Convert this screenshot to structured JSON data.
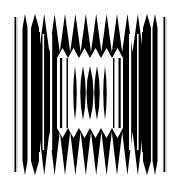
{
  "image": {
    "width": 180,
    "height": 185,
    "background": "#ffffff",
    "ink": "#000000",
    "description": "Black and white op-art pattern of vertical stripes with zigzag top and bottom bands and a central window of lens-shaped spindles"
  },
  "pattern": {
    "outer_lines_left": [
      {
        "x": 14.5,
        "w": 1.6,
        "y1": 17,
        "y2": 172,
        "tone": "#000000"
      },
      {
        "x": 16.2,
        "w": 1.4,
        "y1": 17,
        "y2": 172,
        "tone": "#bdbdbd"
      }
    ],
    "outer_lines_right": [
      {
        "x": 163.5,
        "w": 1.6,
        "y1": 17,
        "y2": 172,
        "tone": "#000000"
      },
      {
        "x": 165.2,
        "w": 1.4,
        "y1": 17,
        "y2": 172,
        "tone": "#bdbdbd"
      }
    ],
    "spikes_left": [
      {
        "x": 22.5,
        "w": 5,
        "y1": 14,
        "y2": 175
      },
      {
        "x": 31,
        "w": 8,
        "y1": 14,
        "y2": 175
      }
    ],
    "spikes_right": [
      {
        "x": 143,
        "w": 8,
        "y1": 14,
        "y2": 175
      },
      {
        "x": 152.5,
        "w": 5,
        "y1": 14,
        "y2": 175
      }
    ],
    "block": {
      "x1": 39,
      "x2": 143,
      "top": 14,
      "bottom": 175
    },
    "top_teeth": {
      "x1": 39,
      "x2": 143,
      "count": 10,
      "peak_y": 14,
      "valley_y": 52
    },
    "bottom_teeth": {
      "x1": 39,
      "x2": 143,
      "count": 10,
      "peak_y": 175,
      "valley_y": 132
    },
    "inner_window": {
      "x1": 57,
      "x2": 123,
      "top": 58,
      "bottom": 128,
      "tooth_count": 6,
      "tooth_depth": 10
    },
    "inner_stripes": [
      {
        "x": 42.5,
        "w": 1.6,
        "tone": "#ffffff"
      },
      {
        "x": 50,
        "w": 2.2,
        "tone": "#ffffff"
      },
      {
        "x": 129,
        "w": 2.2,
        "tone": "#ffffff"
      },
      {
        "x": 137,
        "w": 1.6,
        "tone": "#ffffff"
      }
    ],
    "window_frame_lines": [
      {
        "x": 60,
        "w": 2.2
      },
      {
        "x": 66.5,
        "w": 1.4
      },
      {
        "x": 113,
        "w": 1.4
      },
      {
        "x": 118.5,
        "w": 2.2
      }
    ],
    "spindles": [
      {
        "cx": 75,
        "w": 3.5,
        "top": 66,
        "bottom": 120
      },
      {
        "cx": 83,
        "w": 5.5,
        "top": 66,
        "bottom": 120
      },
      {
        "cx": 90,
        "w": 7,
        "top": 66,
        "bottom": 120
      },
      {
        "cx": 97,
        "w": 5.5,
        "top": 66,
        "bottom": 120
      },
      {
        "cx": 105,
        "w": 3.5,
        "top": 66,
        "bottom": 120
      }
    ]
  }
}
